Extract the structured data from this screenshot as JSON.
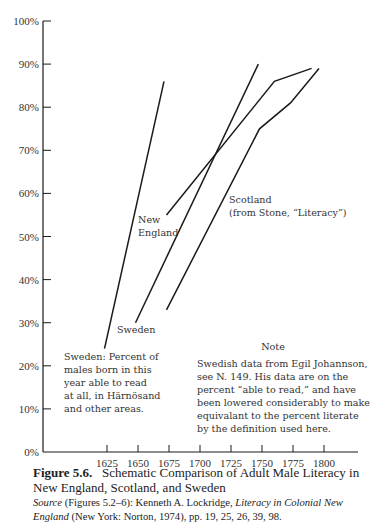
{
  "chart_data": {
    "type": "line",
    "title": "Schematic Comparison of Adult Male Literacy in New England, Scotland, and Sweden",
    "xlabel": "",
    "ylabel": "",
    "xlim": [
      1600,
      1825
    ],
    "ylim": [
      0,
      100
    ],
    "x_ticks": [
      1625,
      1650,
      1675,
      1700,
      1725,
      1750,
      1775,
      1800
    ],
    "y_ticks": [
      "0%",
      "10%",
      "20%",
      "30%",
      "40%",
      "50%",
      "60%",
      "70%",
      "80%",
      "90%",
      "100%"
    ],
    "grid": false,
    "legend": "none (direct line labels)",
    "series": [
      {
        "name": "Sweden: Percent of males born in this year able to read at all, in Härnösand and other areas",
        "points": [
          [
            1623,
            24
          ],
          [
            1671,
            86
          ]
        ]
      },
      {
        "name": "Sweden",
        "points": [
          [
            1648,
            30
          ],
          [
            1747,
            90
          ]
        ]
      },
      {
        "name": "New England",
        "points": [
          [
            1673,
            55
          ],
          [
            1760,
            86
          ],
          [
            1790,
            89
          ]
        ]
      },
      {
        "name": "Scotland (from Stone, \"Literacy\")",
        "points": [
          [
            1673,
            33
          ],
          [
            1748,
            75
          ],
          [
            1773,
            81
          ],
          [
            1796,
            89
          ]
        ]
      }
    ]
  },
  "labels": {
    "new_england_1": "New",
    "new_england_2": "England",
    "scotland_1": "Scotland",
    "scotland_2": "(from Stone, “Literacy”)",
    "sweden": "Sweden",
    "sweden_note": [
      "Sweden:  Percent of",
      "males born in this",
      "year able to read",
      "at all, in Härnösand",
      "and other areas."
    ],
    "note_title": "Note",
    "note_lines": [
      "Swedish data from Egil Johannson,",
      "see N. 149.  His data are on the",
      "percent “able to read,” and have",
      "been lowered considerably to make",
      "equivalant to the percent literate",
      "by the definition used here."
    ]
  },
  "caption": {
    "figure_number": "Figure 5.6.",
    "title": "Schematic Comparison of Adult Male Literacy in New England, Scotland, and Sweden",
    "source_label": "Source",
    "source_pre": " (Figures 5.2–6): Kenneth A. Lockridge, ",
    "source_book": "Literacy in Colonial New England",
    "source_post": " (New York: Norton, 1974), pp. 19, 25, 26, 39, 98."
  },
  "colors": {
    "line": "#1a1a1a",
    "text": "#2a2a2a"
  }
}
